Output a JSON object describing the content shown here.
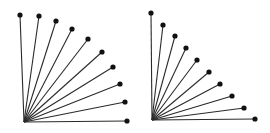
{
  "figure": {
    "width": 270,
    "height": 133,
    "background": "#ffffff",
    "line_color": "#2a2a2a",
    "dot_color": "#111111",
    "line_width": 1.1,
    "dot_radius": 2.6
  },
  "fans": [
    {
      "name": "left-fan-arc",
      "description": "rays of equal length, endpoints on a quarter circle",
      "origin": [
        24,
        122
      ],
      "endpoints": [
        [
          20,
          15
        ],
        [
          39,
          16
        ],
        [
          56,
          21
        ],
        [
          72,
          29
        ],
        [
          88,
          39
        ],
        [
          102,
          52
        ],
        [
          113,
          67
        ],
        [
          120,
          84
        ],
        [
          125,
          102
        ],
        [
          127,
          121
        ]
      ]
    },
    {
      "name": "right-fan-diagonal",
      "description": "rays whose endpoints lie on a straight diagonal line",
      "origin": [
        152,
        120
      ],
      "endpoints": [
        [
          151,
          13
        ],
        [
          163,
          25
        ],
        [
          175,
          36
        ],
        [
          186,
          48
        ],
        [
          197,
          60
        ],
        [
          209,
          72
        ],
        [
          220,
          84
        ],
        [
          232,
          96
        ],
        [
          244,
          108
        ],
        [
          255,
          119
        ]
      ]
    }
  ]
}
